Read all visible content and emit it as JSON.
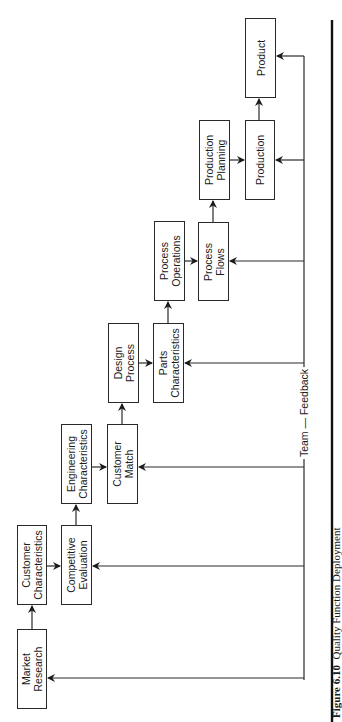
{
  "diagram": {
    "orientation": "rotated-90-ccw",
    "boxes": [
      {
        "id": "market-research",
        "label": "Market\nResearch"
      },
      {
        "id": "customer-characteristics",
        "label": "Customer\nCharacteristics"
      },
      {
        "id": "competitive-evaluation",
        "label": "Competitive\nEvaluation"
      },
      {
        "id": "engineering-characteristics",
        "label": "Engineering\nCharacteristics"
      },
      {
        "id": "customer-match",
        "label": "Customer\nMatch"
      },
      {
        "id": "design-process",
        "label": "Design\nProcess"
      },
      {
        "id": "parts-characteristics",
        "label": "Parts\nCharacteristics"
      },
      {
        "id": "process-operations",
        "label": "Process\nOperations"
      },
      {
        "id": "process-flows",
        "label": "Process\nFlows"
      },
      {
        "id": "production-planning",
        "label": "Production\nPlanning"
      },
      {
        "id": "production",
        "label": "Production"
      },
      {
        "id": "product",
        "label": "Product"
      }
    ],
    "feedback_label": "Team — Feedback",
    "feedback_targets": [
      "Market Research",
      "Competitive Evaluation",
      "Customer Match",
      "Parts Characteristics",
      "Process Flows",
      "Production",
      "Product"
    ],
    "caption": {
      "number": "Figure 6.10",
      "text": "Quality Function Deployment"
    }
  }
}
